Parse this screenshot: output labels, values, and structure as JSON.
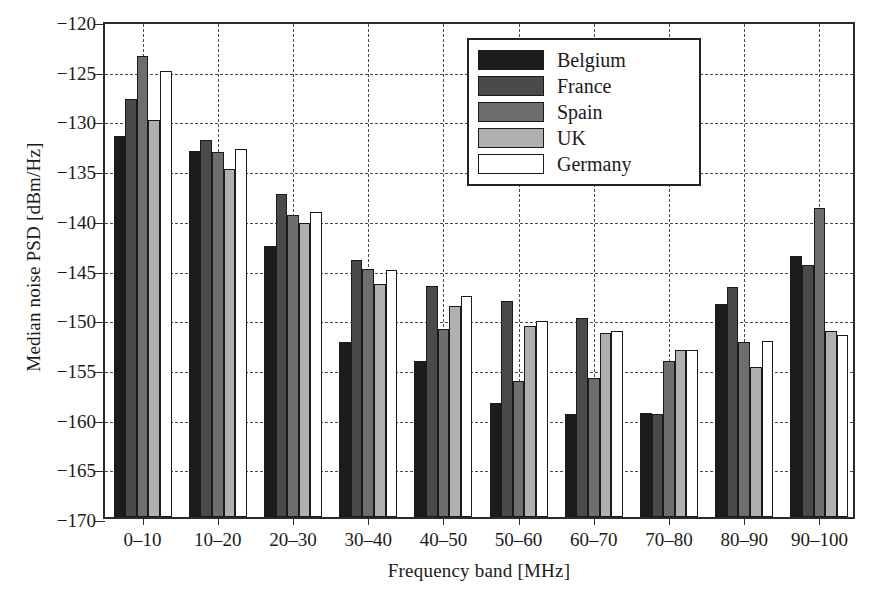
{
  "chart_data": {
    "type": "bar",
    "title": "",
    "xlabel": "Frequency band [MHz]",
    "ylabel": "Median noise PSD [dBm/Hz]",
    "categories": [
      "0–10",
      "10–20",
      "20–30",
      "30–40",
      "40–50",
      "50–60",
      "60–70",
      "70–80",
      "80–90",
      "90–100"
    ],
    "ylim": [
      -170,
      -120
    ],
    "yticks": [
      -120,
      -125,
      -130,
      -135,
      -140,
      -145,
      -150,
      -155,
      -160,
      -165,
      -170
    ],
    "ytick_labels": [
      "−120",
      "−125",
      "−130",
      "−135",
      "−140",
      "−145",
      "−150",
      "−155",
      "−160",
      "−165",
      "−170"
    ],
    "grid": true,
    "legend_position": "top-center",
    "series": [
      {
        "name": "Belgium",
        "color": "#1c1c1c",
        "values": [
          -131.7,
          -133.2,
          -142.7,
          -152.4,
          -154.3,
          -158.5,
          -159.6,
          -159.5,
          -148.6,
          -143.7
        ]
      },
      {
        "name": "France",
        "color": "#4a4a4a",
        "values": [
          -127.9,
          -132.1,
          -137.5,
          -144.1,
          -146.8,
          -148.3,
          -150.0,
          -159.6,
          -146.9,
          -144.6
        ]
      },
      {
        "name": "Spain",
        "color": "#6e6e6e",
        "values": [
          -123.6,
          -133.3,
          -139.6,
          -145.0,
          -151.1,
          -156.3,
          -156.0,
          -154.3,
          -152.4,
          -138.9
        ]
      },
      {
        "name": "UK",
        "color": "#b0b0b0",
        "values": [
          -130.1,
          -135.0,
          -140.4,
          -146.6,
          -148.8,
          -150.8,
          -151.5,
          -153.2,
          -154.9,
          -151.3
        ]
      },
      {
        "name": "Germany",
        "color": "#ffffff",
        "values": [
          -125.1,
          -133.0,
          -139.3,
          -145.1,
          -147.8,
          -150.3,
          -151.3,
          -153.2,
          -152.3,
          -151.7
        ]
      }
    ]
  },
  "legend": {
    "items": [
      {
        "label": "Belgium"
      },
      {
        "label": "France"
      },
      {
        "label": "Spain"
      },
      {
        "label": "UK"
      },
      {
        "label": "Germany"
      }
    ]
  }
}
